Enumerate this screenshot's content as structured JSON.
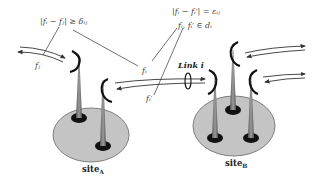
{
  "figure": {
    "kind": "wireless link frequency assignment diagram",
    "colors": {
      "background": "#ffffff",
      "site_fill": "#c4c4c4",
      "site_stroke": "#555555",
      "antenna_fill": "#7a7a7a",
      "antenna_base": "#111111",
      "dish": "#111111",
      "line": "#333333"
    },
    "labels": {
      "constraint_interference": "|fᵢ − fⱼ| ≥ δᵢⱼ",
      "constraint_pair": "|fᵢ − fᵢ′| = εᵢⱼ",
      "constraint_domain": "fᵢ, fᵢ′ ∈ dᵢ",
      "freq_fj": "fⱼ",
      "freq_fi": "fᵢ",
      "freq_fi_prime": "fᵢ′",
      "link": "Link i",
      "site_a": "site",
      "site_a_sub": "A",
      "site_b": "site",
      "site_b_sub": "B"
    },
    "sites": [
      {
        "name": "site A",
        "antennas": 2
      },
      {
        "name": "site B",
        "antennas": 3
      }
    ]
  }
}
